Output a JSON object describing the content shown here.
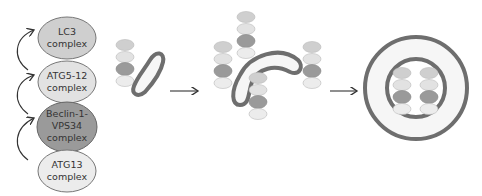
{
  "colors": {
    "lc3": "#cfcfcf",
    "atg5_12": "#e2e2e2",
    "beclin": "#9a9a9a",
    "atg13": "#ececec",
    "membrane": "#6e6e6e",
    "membrane_fill": "#f6f6f6",
    "arrow": "#333333"
  },
  "complexes": [
    {
      "line1": "LC3",
      "line2": "complex"
    },
    {
      "line1": "ATG5-12",
      "line2": "complex"
    },
    {
      "line1": "Beclin-1-",
      "line2": "VPS34",
      "line3": "complex"
    },
    {
      "line1": "ATG13",
      "line2": "complex"
    }
  ],
  "stages": [
    "phagophore-nucleation",
    "phagophore-elongation",
    "autophagosome"
  ]
}
